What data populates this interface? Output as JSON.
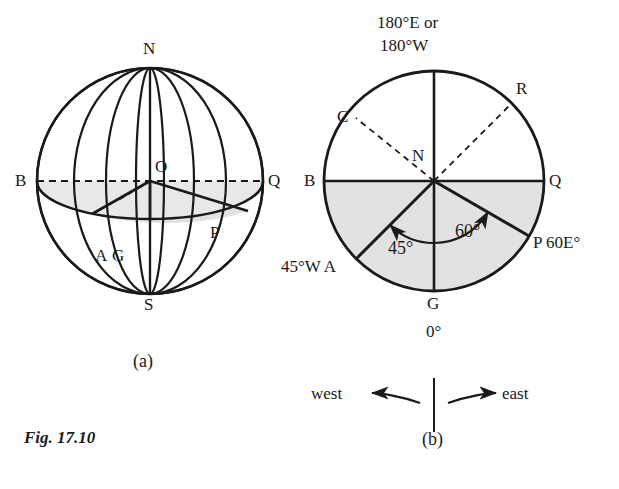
{
  "figure": {
    "caption": "Fig. 17.10",
    "background_color": "#ffffff",
    "ink_color": "#1a1a1a",
    "shade_color": "#e2e2e2"
  },
  "panel_a": {
    "sublabel": "(a)",
    "type": "sphere-globe",
    "points": [
      {
        "id": "N",
        "label": "N",
        "meaning": "north-pole"
      },
      {
        "id": "S",
        "label": "S",
        "meaning": "south-pole"
      },
      {
        "id": "O",
        "label": "O",
        "meaning": "centre-of-earth"
      },
      {
        "id": "B",
        "label": "B",
        "meaning": "left-equator-point"
      },
      {
        "id": "Q",
        "label": "Q",
        "meaning": "right-equator-point"
      },
      {
        "id": "A",
        "label": "A",
        "meaning": "point-A"
      },
      {
        "id": "G",
        "label": "G",
        "meaning": "greenwich-point"
      },
      {
        "id": "P",
        "label": "P",
        "meaning": "point-P"
      }
    ]
  },
  "panel_b": {
    "sublabel": "(b)",
    "type": "plan-view-circle",
    "top_label_line1": "180°E or",
    "top_label_line2": "180°W",
    "points": [
      {
        "id": "N",
        "label": "N",
        "meaning": "north-pole-centre"
      },
      {
        "id": "B",
        "label": "B",
        "meaning": "left-point"
      },
      {
        "id": "Q",
        "label": "Q",
        "meaning": "right-point"
      },
      {
        "id": "C",
        "label": "C",
        "meaning": "point-C"
      },
      {
        "id": "R",
        "label": "R",
        "meaning": "point-R"
      },
      {
        "id": "G",
        "label": "G",
        "meaning": "greenwich-meridian-point"
      },
      {
        "id": "A",
        "label": "A",
        "meaning": "point-A"
      },
      {
        "id": "P",
        "label": "P",
        "meaning": "point-P"
      }
    ],
    "longitude_A": "45°W A",
    "longitude_P": "P 60E°",
    "longitude_G": "0°",
    "angle_A": "45°",
    "angle_P": "60°",
    "compass_west": "west",
    "compass_east": "east"
  }
}
